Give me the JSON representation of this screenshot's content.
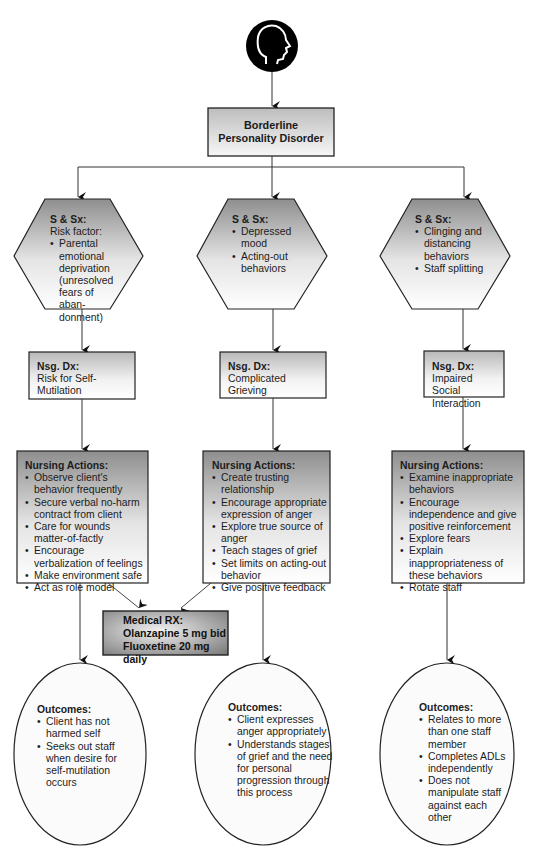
{
  "diagram": {
    "root_icon": "head-profile-icon",
    "title_line1": "Borderline",
    "title_line2": "Personality Disorder",
    "colors": {
      "stroke": "#1a1a1a",
      "line": "#555555",
      "gradient_dark": "#8c8c8c",
      "gradient_light": "#ffffff",
      "rx_dark": "#7a7a7a"
    },
    "branches": [
      {
        "signs": {
          "header": "S & Sx:",
          "intro": "Risk factor:",
          "items": [
            "Parental emotional deprivation (unresolved fears of aban-donment)"
          ]
        },
        "diagnosis": {
          "header": "Nsg. Dx:",
          "text": "Risk for Self-Mutilation"
        },
        "actions": {
          "header": "Nursing Actions:",
          "items": [
            "Observe client's behavior frequently",
            "Secure verbal no-harm contract from client",
            "Care for wounds matter-of-factly",
            "Encourage verbalization of feelings",
            "Make environment safe",
            "Act as role model"
          ]
        },
        "outcomes": {
          "header": "Outcomes:",
          "items": [
            "Client has not harmed self",
            "Seeks out staff when desire for self-mutilation occurs"
          ]
        }
      },
      {
        "signs": {
          "header": "S & Sx:",
          "intro": "",
          "items": [
            "Depressed mood",
            "Acting-out behaviors"
          ]
        },
        "diagnosis": {
          "header": "Nsg. Dx:",
          "text": "Complicated Grieving"
        },
        "actions": {
          "header": "Nursing Actions:",
          "items": [
            "Create trusting relationship",
            "Encourage appropriate expression of anger",
            "Explore true source of anger",
            "Teach stages of grief",
            "Set limits on acting-out behavior",
            "Give positive feedback"
          ]
        },
        "outcomes": {
          "header": "Outcomes:",
          "items": [
            "Client expresses anger appropriately",
            "Understands stages of grief and the need for personal progression through this process"
          ]
        }
      },
      {
        "signs": {
          "header": "S & Sx:",
          "intro": "",
          "items": [
            "Clinging and distancing behaviors",
            "Staff splitting"
          ]
        },
        "diagnosis": {
          "header": "Nsg. Dx:",
          "text": "Impaired Social Interaction"
        },
        "actions": {
          "header": "Nursing Actions:",
          "items": [
            "Examine inappropriate behaviors",
            "Encourage independence and give positive reinforcement",
            "Explore fears",
            "Explain inappropriateness of these behaviors",
            "Rotate staff"
          ]
        },
        "outcomes": {
          "header": "Outcomes:",
          "items": [
            "Relates to more than one staff member",
            "Completes ADLs independently",
            "Does not manipulate staff against each other"
          ]
        }
      }
    ],
    "medical_rx": {
      "header": "Medical RX:",
      "lines": [
        "Olanzapine 5 mg bid",
        "Fluoxetine 20 mg daily"
      ]
    }
  }
}
